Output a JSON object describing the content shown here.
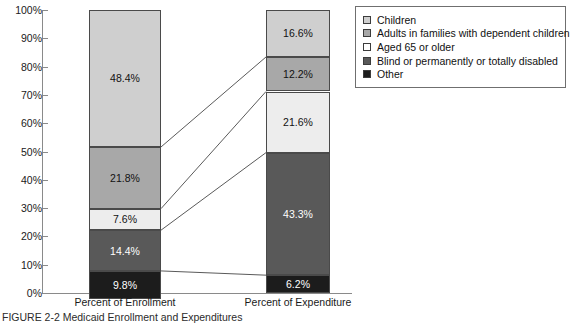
{
  "chart_data": {
    "type": "bar",
    "subtype": "stacked-100-percent",
    "title": "",
    "xlabel": "",
    "ylabel": "",
    "ylim": [
      0,
      100
    ],
    "y_tick_labels": [
      "100%",
      "90%",
      "80%",
      "70%",
      "60%",
      "50%",
      "40%",
      "30%",
      "20%",
      "10%",
      "0%"
    ],
    "y_ticks": [
      100,
      90,
      80,
      70,
      60,
      50,
      40,
      30,
      20,
      10,
      0
    ],
    "grid": false,
    "legend_position": "top-right",
    "categories": [
      "Percent of Enrollment",
      "Percent of Expenditure"
    ],
    "series": [
      {
        "name": "Children",
        "color": "#cfcfcf",
        "values": [
          48.4,
          16.6
        ],
        "labels": [
          "48.4%",
          "16.6%"
        ]
      },
      {
        "name": "Adults in families with dependent children",
        "color": "#a8a8a8",
        "values": [
          21.8,
          12.2
        ],
        "labels": [
          "21.8%",
          "12.2%"
        ]
      },
      {
        "name": "Aged 65 or older",
        "color": "#ededed",
        "values": [
          7.6,
          21.6
        ],
        "labels": [
          "7.6%",
          "21.6%"
        ]
      },
      {
        "name": "Blind or permanently or totally disabled",
        "color": "#595959",
        "values": [
          14.4,
          43.3
        ],
        "labels": [
          "14.4%",
          "43.3%"
        ]
      },
      {
        "name": "Other",
        "color": "#1c1c1c",
        "values": [
          9.8,
          6.2
        ],
        "labels": [
          "9.8%",
          "6.2%"
        ]
      }
    ]
  },
  "legend": {
    "items": [
      {
        "label": "Children",
        "color": "#cfcfcf"
      },
      {
        "label": "Adults in families with dependent children",
        "color": "#a8a8a8"
      },
      {
        "label": "Aged 65 or older",
        "color": "#ffffff"
      },
      {
        "label": "Blind or permanently or totally disabled",
        "color": "#595959"
      },
      {
        "label": "Other",
        "color": "#1c1c1c"
      }
    ]
  },
  "axis": {
    "category_labels": [
      "Percent of Enrollment",
      "Percent of Expenditure"
    ]
  },
  "caption": {
    "text": "FIGURE 2-2  Medicaid Enrollment and Expenditures"
  }
}
